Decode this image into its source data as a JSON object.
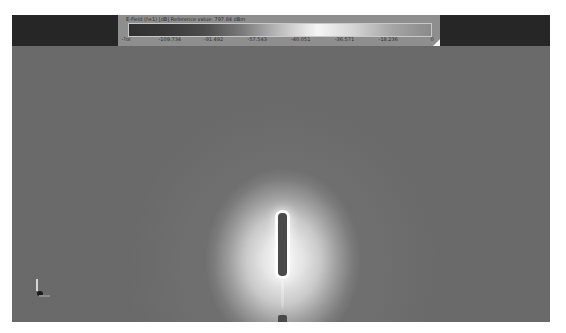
{
  "legend": {
    "title": "E-Field (f=1) [dB] Reference value: 797.84 dBm",
    "colorbar": {
      "gradient_stops": [
        "#303030",
        "#3a3a3a",
        "#4c4c4c",
        "#7a7a7a",
        "#bdbdbd",
        "#f6f6f6",
        "#d2d2d2",
        "#a4a4a4",
        "#8a8a8a"
      ]
    },
    "ticks": [
      {
        "label": "-?ol",
        "fraction": 0.0
      },
      {
        "label": "-109.734",
        "fraction": 0.143
      },
      {
        "label": "-91.492",
        "fraction": 0.286
      },
      {
        "label": "-57.543",
        "fraction": 0.429
      },
      {
        "label": "-40.051",
        "fraction": 0.571
      },
      {
        "label": "-36.571",
        "fraction": 0.714
      },
      {
        "label": "-18.236",
        "fraction": 0.857
      },
      {
        "label": "0",
        "fraction": 1.0
      }
    ]
  },
  "colors": {
    "background": "#6c6c6c",
    "top_bars": "#262626",
    "legend_panel": "#8e8e8e",
    "field_peak": "#f4f4f4",
    "rod": "#4a4a4a"
  },
  "icons": {
    "axis_triad": "axis-triad-icon",
    "resize_grip": "resize-grip-icon"
  }
}
